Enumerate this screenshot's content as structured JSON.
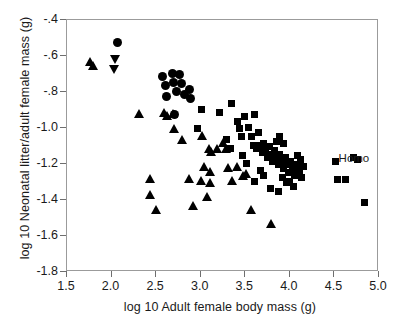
{
  "chart_data": {
    "type": "scatter",
    "title": "",
    "xlabel": "log 10 Adult female body mass (g)",
    "ylabel": "log 10 Neonatal litter/adult female mass (g)",
    "xlim": [
      1.5,
      5.0
    ],
    "ylim": [
      -1.8,
      -0.4
    ],
    "xticks": [
      "1.5",
      "2.0",
      "2.5",
      "3.0",
      "3.5",
      "4.0",
      "4.5",
      "5.0"
    ],
    "xtick_values": [
      1.5,
      2.0,
      2.5,
      3.0,
      3.5,
      4.0,
      4.5,
      5.0
    ],
    "yticks": [
      "-.4",
      "-.6",
      "-.8",
      "-1.0",
      "-1.2",
      "-1.4",
      "-1.6",
      "-1.8"
    ],
    "ytick_values": [
      -0.4,
      -0.6,
      -0.8,
      -1.0,
      -1.2,
      -1.4,
      -1.6,
      -1.8
    ],
    "grid": false,
    "legend": "none",
    "annotations": [
      {
        "text": "Homo",
        "x": 4.73,
        "y": -1.17
      }
    ],
    "series": [
      {
        "name": "circles",
        "marker": "circle",
        "points": [
          [
            2.08,
            -0.53
          ],
          [
            2.58,
            -0.72
          ],
          [
            2.62,
            -0.77
          ],
          [
            2.63,
            -0.83
          ],
          [
            2.69,
            -0.7
          ],
          [
            2.71,
            -0.75
          ],
          [
            2.74,
            -0.8
          ],
          [
            2.77,
            -0.71
          ],
          [
            2.8,
            -0.76
          ],
          [
            2.83,
            -0.82
          ],
          [
            2.88,
            -0.79
          ],
          [
            2.9,
            -0.84
          ],
          [
            2.72,
            -0.93
          ]
        ]
      },
      {
        "name": "down-triangles",
        "marker": "tri-down",
        "points": [
          [
            2.05,
            -0.62
          ],
          [
            2.04,
            -0.68
          ]
        ]
      },
      {
        "name": "up-triangles",
        "marker": "tri-up",
        "points": [
          [
            1.77,
            -0.64
          ],
          [
            1.8,
            -0.66
          ],
          [
            2.32,
            -0.93
          ],
          [
            2.6,
            -0.92
          ],
          [
            2.63,
            -0.94
          ],
          [
            2.7,
            -0.93
          ],
          [
            2.71,
            -1.01
          ],
          [
            2.8,
            -1.07
          ],
          [
            2.44,
            -1.29
          ],
          [
            2.44,
            -1.38
          ],
          [
            2.51,
            -1.46
          ],
          [
            2.88,
            -1.29
          ],
          [
            2.93,
            -1.44
          ],
          [
            3.03,
            -1.05
          ],
          [
            3.1,
            -1.12
          ],
          [
            3.13,
            -1.14
          ],
          [
            3.19,
            -1.12
          ],
          [
            3.05,
            -1.22
          ],
          [
            3.11,
            -1.25
          ],
          [
            3.01,
            -1.3
          ],
          [
            3.12,
            -1.31
          ],
          [
            3.08,
            -1.39
          ],
          [
            3.32,
            -1.23
          ],
          [
            3.36,
            -1.3
          ],
          [
            3.42,
            -1.22
          ],
          [
            3.48,
            -1.27
          ],
          [
            3.52,
            -1.26
          ],
          [
            3.3,
            -1.12
          ],
          [
            3.26,
            -1.09
          ],
          [
            3.57,
            -1.46
          ],
          [
            3.8,
            -1.54
          ]
        ]
      },
      {
        "name": "squares",
        "marker": "square",
        "points": [
          [
            3.02,
            -0.9
          ],
          [
            2.98,
            -1.01
          ],
          [
            3.22,
            -0.92
          ],
          [
            3.36,
            -0.87
          ],
          [
            3.42,
            -0.97
          ],
          [
            3.45,
            -1.01
          ],
          [
            3.47,
            -1.05
          ],
          [
            3.5,
            -0.94
          ],
          [
            3.55,
            -1.0
          ],
          [
            3.58,
            -1.05
          ],
          [
            3.62,
            -0.93
          ],
          [
            3.66,
            -1.03
          ],
          [
            3.3,
            -1.07
          ],
          [
            3.35,
            -1.12
          ],
          [
            3.6,
            -1.1
          ],
          [
            3.64,
            -1.12
          ],
          [
            3.68,
            -1.1
          ],
          [
            3.72,
            -1.09
          ],
          [
            3.7,
            -1.14
          ],
          [
            3.74,
            -1.13
          ],
          [
            3.76,
            -1.17
          ],
          [
            3.78,
            -1.11
          ],
          [
            3.8,
            -1.15
          ],
          [
            3.82,
            -1.19
          ],
          [
            3.84,
            -1.13
          ],
          [
            3.86,
            -1.17
          ],
          [
            3.88,
            -1.21
          ],
          [
            3.9,
            -1.15
          ],
          [
            3.92,
            -1.19
          ],
          [
            3.94,
            -1.23
          ],
          [
            3.96,
            -1.17
          ],
          [
            3.98,
            -1.21
          ],
          [
            4.0,
            -1.25
          ],
          [
            4.02,
            -1.19
          ],
          [
            4.04,
            -1.23
          ],
          [
            4.06,
            -1.27
          ],
          [
            3.93,
            -1.28
          ],
          [
            3.97,
            -1.31
          ],
          [
            4.01,
            -1.3
          ],
          [
            4.05,
            -1.33
          ],
          [
            4.09,
            -1.21
          ],
          [
            4.12,
            -1.24
          ],
          [
            4.14,
            -1.28
          ],
          [
            4.16,
            -1.22
          ],
          [
            3.86,
            -1.08
          ],
          [
            3.9,
            -1.05
          ],
          [
            3.94,
            -1.09
          ],
          [
            4.1,
            -1.16
          ],
          [
            4.13,
            -1.18
          ],
          [
            3.48,
            -1.16
          ],
          [
            3.52,
            -1.2
          ],
          [
            3.68,
            -1.24
          ],
          [
            3.72,
            -1.27
          ],
          [
            3.62,
            -1.3
          ],
          [
            3.79,
            -1.34
          ],
          [
            3.88,
            -1.36
          ],
          [
            4.52,
            -1.19
          ],
          [
            4.55,
            -1.29
          ],
          [
            4.63,
            -1.29
          ],
          [
            4.77,
            -1.18
          ],
          [
            4.85,
            -1.42
          ],
          [
            4.73,
            -1.17
          ]
        ]
      }
    ]
  }
}
